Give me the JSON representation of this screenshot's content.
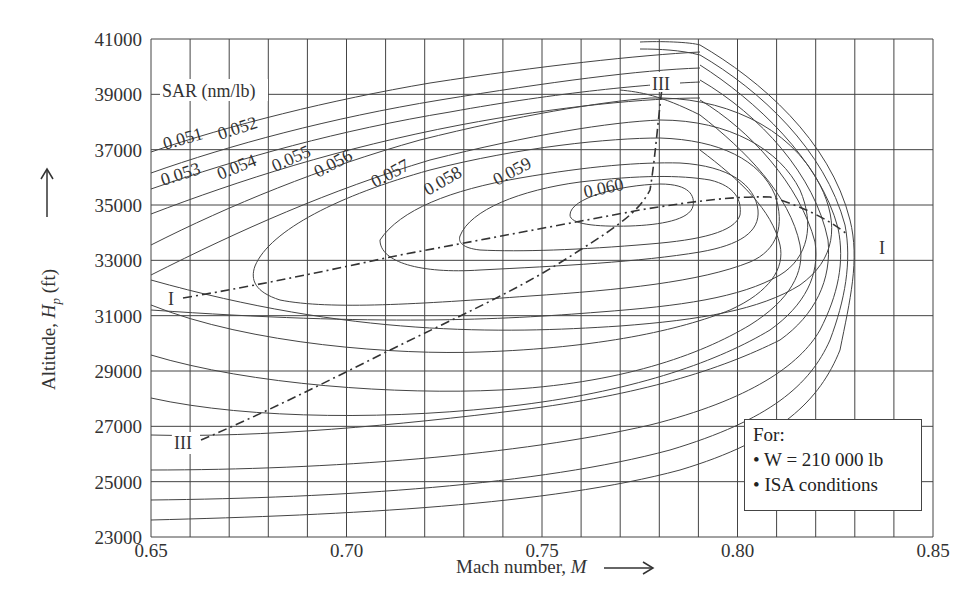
{
  "chart_data": {
    "type": "line",
    "subtype": "contour",
    "title": "",
    "xlabel": "Mach number, M",
    "ylabel": "Altitude, Hp (ft)",
    "xlim": [
      0.65,
      0.85
    ],
    "ylim": [
      23000,
      41000
    ],
    "x_ticks": [
      "0.65",
      "0.70",
      "0.75",
      "0.80",
      "0.85"
    ],
    "y_ticks": [
      "23 000",
      "25 000",
      "27 000",
      "29 000",
      "31 000",
      "33 000",
      "35 000",
      "37 000",
      "39 000",
      "41 000"
    ],
    "grid": true,
    "grid_x_step": 0.01,
    "grid_y_step": 2000,
    "contour_title": "SAR (nm/lb)",
    "contour_levels": [
      "0.051",
      "0.052",
      "0.053",
      "0.054",
      "0.055",
      "0.056",
      "0.057",
      "0.058",
      "0.059",
      "0.060"
    ],
    "lines": [
      {
        "name": "I",
        "style": "dash-dot",
        "description": "Optimum Mach number line",
        "points": [
          [
            0.655,
            31200
          ],
          [
            0.68,
            31900
          ],
          [
            0.71,
            32900
          ],
          [
            0.73,
            33600
          ],
          [
            0.76,
            34400
          ],
          [
            0.78,
            34800
          ],
          [
            0.8,
            35100
          ],
          [
            0.81,
            35050
          ],
          [
            0.825,
            34300
          ],
          [
            0.835,
            33500
          ]
        ]
      },
      {
        "name": "III",
        "style": "dash-dot",
        "description": "Optimum altitude line",
        "points": [
          [
            0.665,
            25800
          ],
          [
            0.69,
            27200
          ],
          [
            0.71,
            28500
          ],
          [
            0.73,
            30000
          ],
          [
            0.75,
            31800
          ],
          [
            0.77,
            33800
          ],
          [
            0.775,
            34800
          ],
          [
            0.778,
            36200
          ],
          [
            0.78,
            38900
          ]
        ]
      }
    ],
    "annotation": {
      "heading": "For:",
      "items": [
        "W = 210 000 lb",
        "ISA conditions"
      ]
    }
  },
  "labels": {
    "x_axis": "Mach number, M",
    "y_axis": "Altitude, Hp (ft)",
    "sar_title": "SAR (nm/lb)",
    "line_I": "I",
    "line_III": "III",
    "note_heading": "For:",
    "note_item_1": "• W = 210 000 lb",
    "note_item_2": "• ISA conditions"
  }
}
